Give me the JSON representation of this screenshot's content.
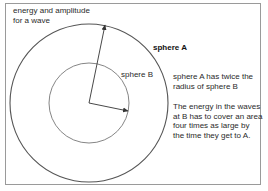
{
  "title": {
    "lines": [
      "energy and amplitude",
      "for a wave"
    ]
  },
  "labels": {
    "sphere_a": "sphere A",
    "sphere_b": "sphere B"
  },
  "notes": {
    "radius_note": [
      "sphere A has twice the",
      "radius of sphere B"
    ],
    "energy_note": [
      "The energy in the waves",
      "at B has to cover an area",
      "four times as large by",
      "the time they get to A."
    ]
  },
  "geometry": {
    "center": [
      89,
      103
    ],
    "sphere_a_radius": 79,
    "sphere_b_radius": 40,
    "stroke_color": "#555555",
    "frame_color": "#9a9a9a"
  }
}
